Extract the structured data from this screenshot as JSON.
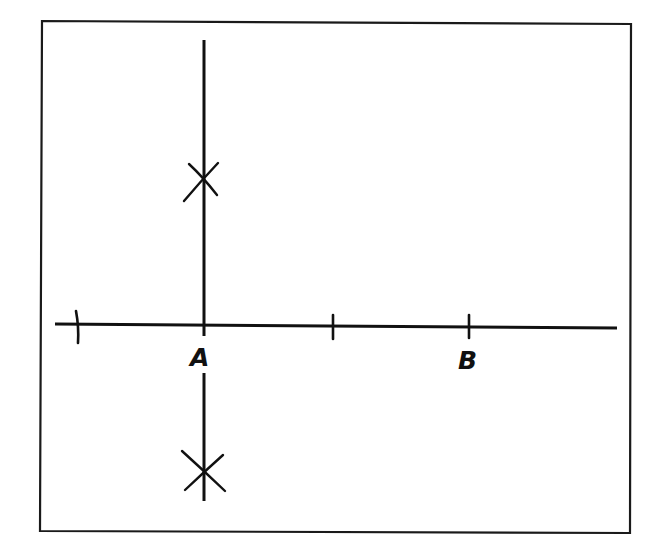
{
  "diagram": {
    "type": "geometric-construction",
    "stroke_color": "#111111",
    "background_color": "#ffffff",
    "frame": {
      "x1": 42,
      "y1": 21,
      "x2": 631,
      "y2": 532
    },
    "horizontal_line": {
      "x1": 55,
      "y1": 324,
      "x2": 617,
      "y2": 328
    },
    "perpendicular_upper": {
      "x": 204,
      "y1": 40,
      "y2": 336
    },
    "perpendicular_lower": {
      "x": 204,
      "y1": 373,
      "y2": 501
    },
    "ticks": [
      {
        "name": "left-tick",
        "x": 77,
        "y1": 311,
        "y2": 343
      },
      {
        "name": "a-tick",
        "x": 204,
        "y1": 316,
        "y2": 336
      },
      {
        "name": "middle-tick",
        "x": 333,
        "y1": 315,
        "y2": 339
      },
      {
        "name": "b-tick",
        "x": 469,
        "y1": 315,
        "y2": 338
      }
    ],
    "arc_marks": [
      {
        "name": "upper-intersection",
        "cx": 204,
        "cy": 178
      },
      {
        "name": "lower-intersection",
        "cx": 204,
        "cy": 473
      }
    ],
    "labels": {
      "point_a": "A",
      "point_b": "B"
    }
  }
}
